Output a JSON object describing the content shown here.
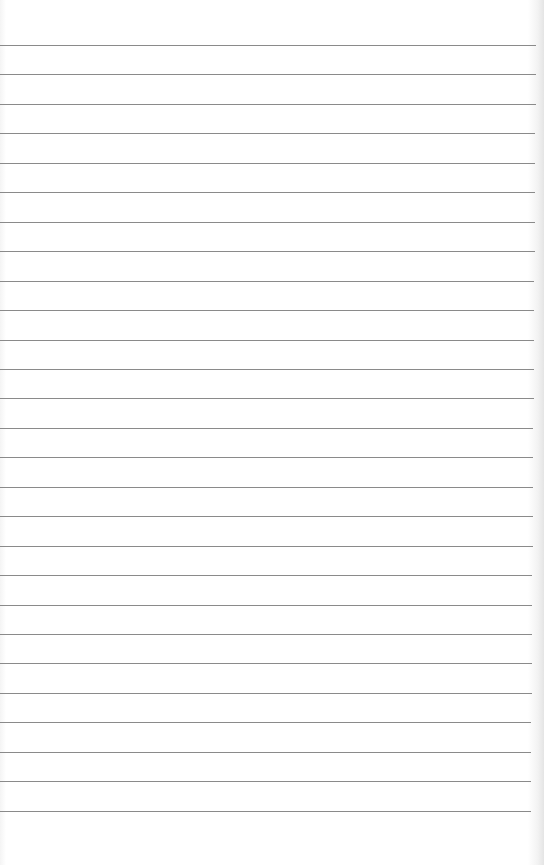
{
  "paper": {
    "type": "ruled notebook page",
    "background_color": "#ffffff",
    "line_color": "#8a8a8a",
    "line_count": 27,
    "first_line_y": 45,
    "line_spacing": 29.45,
    "line_width": 536
  }
}
